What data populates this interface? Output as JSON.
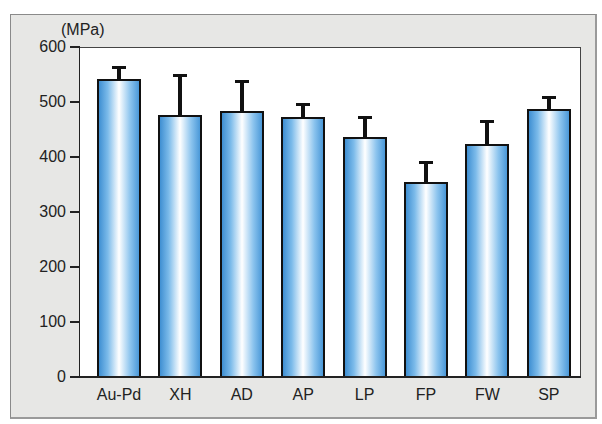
{
  "chart_data": {
    "type": "bar",
    "title": "",
    "xlabel": "",
    "ylabel": "(MPa)",
    "ylim": [
      0,
      600
    ],
    "yticks": [
      0,
      100,
      200,
      300,
      400,
      500,
      600
    ],
    "grid": false,
    "legend": null,
    "categories": [
      "Au-Pd",
      "XH",
      "AD",
      "AP",
      "LP",
      "FP",
      "FW",
      "SP"
    ],
    "values": [
      542,
      476,
      484,
      472,
      436,
      355,
      424,
      487
    ],
    "error_bars": [
      22,
      73,
      54,
      24,
      37,
      36,
      41,
      22
    ],
    "bar_style": "blue gradient fill with black outline, upper error bars only"
  },
  "labels": {
    "unit": "(MPa)",
    "yticks": [
      "0",
      "100",
      "200",
      "300",
      "400",
      "500",
      "600"
    ],
    "categories": [
      "Au-Pd",
      "XH",
      "AD",
      "AP",
      "LP",
      "FP",
      "FW",
      "SP"
    ]
  }
}
